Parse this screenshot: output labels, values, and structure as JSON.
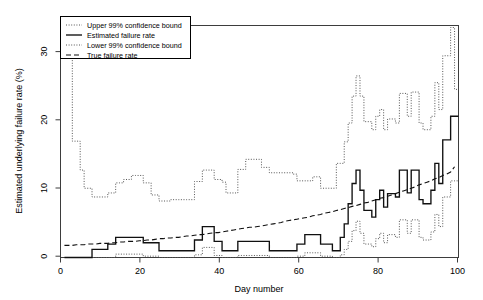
{
  "chart_data": {
    "type": "line",
    "title": "",
    "xlabel": "Day number",
    "ylabel": "Estimated underlying failure rate (%)",
    "xlim": [
      0,
      101
    ],
    "ylim": [
      0,
      34.5
    ],
    "xticks": [
      0,
      20,
      40,
      60,
      80,
      100
    ],
    "yticks": [
      0,
      10,
      20,
      30
    ],
    "grid": false,
    "step_style": "post",
    "legend_position": "top-left",
    "legend": [
      {
        "label": "Upper 99% confidence bound",
        "style": "dotted"
      },
      {
        "label": "Estimated failure rate",
        "style": "solid"
      },
      {
        "label": "Lower 99% confidence bound",
        "style": "dotted"
      },
      {
        "label": "True failure rate",
        "style": "dashed"
      }
    ],
    "x": [
      1,
      2,
      3,
      4,
      5,
      6,
      7,
      8,
      9,
      10,
      11,
      12,
      13,
      14,
      15,
      16,
      17,
      18,
      19,
      20,
      21,
      22,
      23,
      24,
      25,
      26,
      27,
      28,
      29,
      30,
      31,
      32,
      33,
      34,
      35,
      36,
      37,
      38,
      39,
      40,
      41,
      42,
      43,
      44,
      45,
      46,
      47,
      48,
      49,
      50,
      51,
      52,
      53,
      54,
      55,
      56,
      57,
      58,
      59,
      60,
      61,
      62,
      63,
      64,
      65,
      66,
      67,
      68,
      69,
      70,
      71,
      72,
      73,
      74,
      75,
      76,
      77,
      78,
      79,
      80,
      81,
      82,
      83,
      84,
      85,
      86,
      87,
      88,
      89,
      90,
      91,
      92,
      93,
      94,
      95,
      96,
      97,
      98,
      99,
      100
    ],
    "series": [
      {
        "name": "Upper 99% confidence bound",
        "style": "dotted",
        "values": [
          33.2,
          33.2,
          17.3,
          17.3,
          13.0,
          10.3,
          10.3,
          9.0,
          9.0,
          9.0,
          9.0,
          9.6,
          9.6,
          11.1,
          11.1,
          11.6,
          11.6,
          12.2,
          12.2,
          12.2,
          11.1,
          11.1,
          9.3,
          9.3,
          8.4,
          8.4,
          8.4,
          8.6,
          8.6,
          8.6,
          8.6,
          8.6,
          8.6,
          11.3,
          11.3,
          13.0,
          13.0,
          13.0,
          11.6,
          11.6,
          11.2,
          9.6,
          9.6,
          9.6,
          13.1,
          13.1,
          14.6,
          14.6,
          14.6,
          14.6,
          13.4,
          13.4,
          12.6,
          12.6,
          12.6,
          12.6,
          12.6,
          12.6,
          12.4,
          11.4,
          11.4,
          11.4,
          11.4,
          12.0,
          12.0,
          10.3,
          10.3,
          10.3,
          10.3,
          14.0,
          14.0,
          17.2,
          20.0,
          24.0,
          27.0,
          24.0,
          20.2,
          20.2,
          19.0,
          21.0,
          22.0,
          19.0,
          20.6,
          20.6,
          20.0,
          24.4,
          24.4,
          21.0,
          24.6,
          24.6,
          20.0,
          19.0,
          19.0,
          21.0,
          26.0,
          22.0,
          30.0,
          30.0,
          34.2,
          25.0
        ]
      },
      {
        "name": "Estimated failure rate",
        "style": "solid",
        "values": [
          0.0,
          0.0,
          0.0,
          0.0,
          0.0,
          0.0,
          0.0,
          1.2,
          1.2,
          1.2,
          1.2,
          2.0,
          2.0,
          3.0,
          3.0,
          3.0,
          3.0,
          3.0,
          3.0,
          3.0,
          2.2,
          2.2,
          2.2,
          2.2,
          1.0,
          1.0,
          1.0,
          1.0,
          1.0,
          1.0,
          1.0,
          1.0,
          1.0,
          2.6,
          2.6,
          4.6,
          4.6,
          4.6,
          2.4,
          2.4,
          1.0,
          1.0,
          1.0,
          1.0,
          2.4,
          2.4,
          2.4,
          2.4,
          2.4,
          2.4,
          2.4,
          2.4,
          1.0,
          1.0,
          1.0,
          1.0,
          1.0,
          1.0,
          1.0,
          2.0,
          2.0,
          3.4,
          3.4,
          3.4,
          3.4,
          2.0,
          2.0,
          2.0,
          1.0,
          1.0,
          3.0,
          5.0,
          8.0,
          11.0,
          13.0,
          10.0,
          7.0,
          7.0,
          6.0,
          8.6,
          10.0,
          7.5,
          9.5,
          9.5,
          9.0,
          13.0,
          13.0,
          9.6,
          13.0,
          13.0,
          8.6,
          8.0,
          8.0,
          10.0,
          14.0,
          11.0,
          17.5,
          17.5,
          21.0,
          21.0
        ]
      },
      {
        "name": "Lower 99% confidence bound",
        "style": "dotted",
        "values": [
          0.0,
          0.0,
          0.0,
          0.0,
          0.0,
          0.0,
          0.0,
          0.0,
          0.0,
          0.0,
          0.0,
          0.0,
          0.0,
          0.5,
          0.5,
          0.5,
          0.5,
          0.5,
          0.5,
          0.5,
          0.2,
          0.2,
          0.2,
          0.2,
          0.0,
          0.0,
          0.0,
          0.0,
          0.0,
          0.0,
          0.0,
          0.0,
          0.0,
          0.4,
          0.4,
          1.5,
          1.5,
          1.5,
          0.3,
          0.3,
          0.0,
          0.0,
          0.0,
          0.0,
          0.3,
          0.3,
          0.3,
          0.3,
          0.3,
          0.3,
          0.3,
          0.3,
          0.0,
          0.0,
          0.0,
          0.0,
          0.0,
          0.0,
          0.0,
          0.2,
          0.2,
          0.7,
          0.7,
          0.7,
          0.7,
          0.2,
          0.2,
          0.2,
          0.0,
          0.0,
          0.4,
          1.2,
          2.4,
          4.0,
          5.4,
          3.6,
          2.0,
          2.0,
          1.6,
          2.8,
          3.6,
          2.2,
          3.4,
          3.4,
          3.0,
          5.6,
          5.6,
          3.6,
          5.6,
          5.6,
          3.0,
          2.6,
          2.6,
          3.8,
          6.4,
          4.6,
          9.0,
          9.0,
          11.4,
          11.4
        ]
      },
      {
        "name": "True failure rate",
        "style": "dashed",
        "values": [
          1.8,
          1.8,
          1.8,
          1.9,
          1.9,
          1.9,
          2.0,
          2.0,
          2.0,
          2.1,
          2.1,
          2.1,
          2.2,
          2.2,
          2.3,
          2.3,
          2.4,
          2.4,
          2.4,
          2.5,
          2.5,
          2.6,
          2.6,
          2.7,
          2.8,
          2.8,
          2.9,
          2.9,
          3.0,
          3.0,
          3.1,
          3.2,
          3.2,
          3.3,
          3.4,
          3.4,
          3.5,
          3.6,
          3.7,
          3.7,
          3.8,
          3.9,
          4.0,
          4.1,
          4.2,
          4.3,
          4.4,
          4.5,
          4.5,
          4.6,
          4.7,
          4.8,
          4.9,
          5.0,
          5.1,
          5.2,
          5.4,
          5.5,
          5.6,
          5.7,
          5.8,
          5.9,
          6.0,
          6.2,
          6.3,
          6.4,
          6.6,
          6.7,
          6.8,
          7.0,
          7.1,
          7.3,
          7.4,
          7.6,
          7.7,
          7.9,
          8.1,
          8.2,
          8.4,
          8.6,
          8.8,
          8.9,
          9.1,
          9.3,
          9.5,
          9.7,
          9.9,
          10.1,
          10.3,
          10.5,
          10.8,
          11.0,
          11.2,
          11.4,
          11.7,
          11.9,
          12.2,
          12.4,
          12.7,
          13.5
        ]
      }
    ]
  }
}
